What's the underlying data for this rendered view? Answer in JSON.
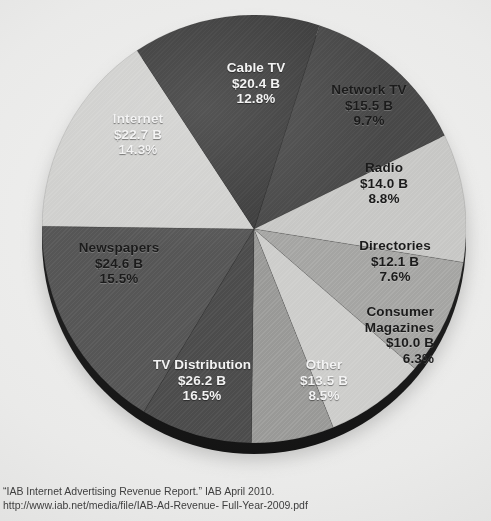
{
  "chart_data": {
    "type": "pie",
    "title": "",
    "subtitle": "",
    "xlabel": "",
    "ylabel": "",
    "legend_position": "none",
    "grid": false,
    "value_unit": "$ Billions",
    "total_value": "$159.0 B",
    "categories": [
      "Cable TV",
      "Network TV",
      "Radio",
      "Directories",
      "Consumer Magazines",
      "Other",
      "TV Distribution",
      "Newspapers",
      "Internet"
    ],
    "values": [
      20.4,
      15.5,
      14.0,
      12.1,
      10.0,
      13.5,
      26.2,
      24.6,
      22.7
    ],
    "percentages": [
      12.8,
      9.7,
      8.8,
      7.6,
      6.3,
      8.5,
      16.5,
      15.5,
      14.3
    ],
    "slices": [
      {
        "name": "Cable TV",
        "value_label": "$20.4 B",
        "pct_label": "12.8%",
        "value": 20.4,
        "pct": 12.8,
        "color": "#4a4a4a",
        "text_style": "light"
      },
      {
        "name": "Network TV",
        "value_label": "$15.5 B",
        "pct_label": "9.7%",
        "value": 15.5,
        "pct": 9.7,
        "color": "#c9c9c7",
        "text_style": "dark"
      },
      {
        "name": "Radio",
        "value_label": "$14.0 B",
        "pct_label": "8.8%",
        "value": 14.0,
        "pct": 8.8,
        "color": "#a8a8a6",
        "text_style": "dark"
      },
      {
        "name": "Directories",
        "value_label": "$12.1 B",
        "pct_label": "7.6%",
        "value": 12.1,
        "pct": 7.6,
        "color": "#cfcfcd",
        "text_style": "dark"
      },
      {
        "name": "Consumer Magazines",
        "value_label": "$10.0 B",
        "pct_label": "6.3%",
        "value": 10.0,
        "pct": 6.3,
        "color": "#9d9d9b",
        "text_style": "dark"
      },
      {
        "name": "Other",
        "value_label": "$13.5 B",
        "pct_label": "8.5%",
        "value": 13.5,
        "pct": 8.5,
        "color": "#4f4f4f",
        "text_style": "light"
      },
      {
        "name": "TV Distribution",
        "value_label": "$26.2 B",
        "pct_label": "16.5%",
        "value": 26.2,
        "pct": 16.5,
        "color": "#595959",
        "text_style": "light"
      },
      {
        "name": "Newspapers",
        "value_label": "$24.6 B",
        "pct_label": "15.5%",
        "value": 24.6,
        "pct": 15.5,
        "color": "#d2d2d0",
        "text_style": "dark"
      },
      {
        "name": "Internet",
        "value_label": "$22.7 B",
        "pct_label": "14.3%",
        "value": 22.7,
        "pct": 14.3,
        "color": "#3f3f3f",
        "text_style": "light"
      }
    ]
  },
  "labels": {
    "cable_tv": {
      "name": "Cable TV",
      "value": "$20.4 B",
      "pct": "12.8%"
    },
    "network_tv": {
      "name": "Network TV",
      "value": "$15.5 B",
      "pct": "9.7%"
    },
    "radio": {
      "name": "Radio",
      "value": "$14.0 B",
      "pct": "8.8%"
    },
    "directories": {
      "name": "Directories",
      "value": "$12.1 B",
      "pct": "7.6%"
    },
    "consumer_magazines": {
      "name_line1": "Consumer",
      "name_line2": "Magazines",
      "value": "$10.0 B",
      "pct": "6.3%"
    },
    "other": {
      "name": "Other",
      "value": "$13.5 B",
      "pct": "8.5%"
    },
    "tv_distribution": {
      "name": "TV Distribution",
      "value": "$26.2 B",
      "pct": "16.5%"
    },
    "newspapers": {
      "name": "Newspapers",
      "value": "$24.6 B",
      "pct": "15.5%"
    },
    "internet": {
      "name": "Internet",
      "value": "$22.7 B",
      "pct": "14.3%"
    }
  },
  "source": {
    "line1": "“IAB Internet Advertising Revenue Report.” IAB April 2010.",
    "line2": "http://www.iab.net/media/file/IAB-Ad-Revenue- Full-Year-2009.pdf"
  },
  "colors": {
    "background": "#ececeb",
    "pie_side": "#242424",
    "text_dark": "#1b1b1b",
    "text_light": "#f3f3f3",
    "source_text": "#3e3e3e"
  }
}
